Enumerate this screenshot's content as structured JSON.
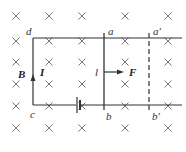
{
  "diagram": {
    "field_symbol": "×",
    "field_direction": "into-page",
    "labels": {
      "d": "d",
      "a": "a",
      "a_prime": "a′",
      "c": "c",
      "b": "b",
      "b_prime": "b′",
      "field": "B",
      "current": "I",
      "rod_length": "l",
      "force": "F"
    },
    "cross_columns_x": [
      16,
      49,
      82,
      125,
      168
    ],
    "cross_rows_y": [
      16,
      41,
      62,
      84,
      106,
      128
    ],
    "colors": {
      "line": "#333333",
      "cross": "#777777",
      "background": "#ffffff"
    }
  }
}
